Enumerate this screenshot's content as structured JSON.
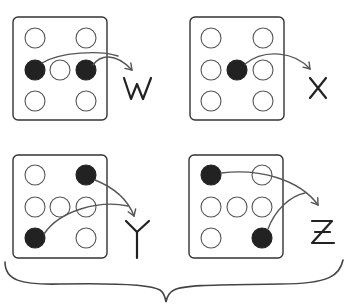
{
  "diagram": {
    "colors": {
      "filled_dot": "#222222",
      "empty_dot_stroke": "#555555",
      "box_stroke": "#333333",
      "arrow": "#555555"
    },
    "panels": [
      {
        "id": "W",
        "label": "W",
        "grid": [
          [
            "empty",
            null,
            "empty"
          ],
          [
            "filled",
            "empty",
            "filled"
          ],
          [
            "empty",
            null,
            "empty"
          ]
        ],
        "arrows_from": [
          "row2-col1",
          "row2-col3"
        ]
      },
      {
        "id": "X",
        "label": "X",
        "grid": [
          [
            "empty",
            null,
            "empty"
          ],
          [
            "empty",
            "filled",
            "empty"
          ],
          [
            "empty",
            null,
            "empty"
          ]
        ],
        "arrows_from": [
          "row2-col2"
        ]
      },
      {
        "id": "Y",
        "label": "Y",
        "grid": [
          [
            "empty",
            null,
            "filled"
          ],
          [
            "empty",
            "empty",
            "empty"
          ],
          [
            "filled",
            null,
            "empty"
          ]
        ],
        "arrows_from": [
          "row1-col3",
          "row3-col1"
        ]
      },
      {
        "id": "Z",
        "label": "Z",
        "grid": [
          [
            "filled",
            null,
            "empty"
          ],
          [
            "empty",
            "empty",
            "empty"
          ],
          [
            "empty",
            null,
            "filled"
          ]
        ],
        "arrows_from": [
          "row1-col1",
          "row3-col3"
        ]
      }
    ],
    "brace": "bottom curly brace spanning all panels"
  }
}
